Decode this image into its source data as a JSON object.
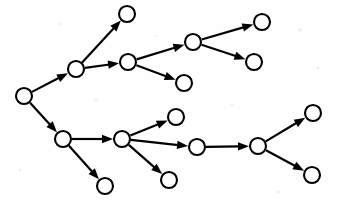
{
  "diagram": {
    "type": "node-link-diagram",
    "canvas": {
      "width": 337,
      "height": 204
    },
    "style": {
      "background_color": "#fefefe",
      "node_fill": "#ffffff",
      "node_stroke": "#000000",
      "node_radius": 8,
      "node_stroke_width": 2.1,
      "edge_color": "#000000",
      "edge_width": 2.2,
      "arrowhead_length": 11,
      "arrowhead_half_width": 4.2,
      "directed": true
    },
    "nodes": [
      {
        "id": "n0",
        "label": "",
        "x": 24,
        "y": 96,
        "role": "root"
      },
      {
        "id": "n1",
        "label": "",
        "x": 76,
        "y": 69,
        "role": "branch"
      },
      {
        "id": "n2",
        "label": "",
        "x": 127,
        "y": 14,
        "role": "leaf"
      },
      {
        "id": "n3",
        "label": "",
        "x": 128,
        "y": 62,
        "role": "branch"
      },
      {
        "id": "n4",
        "label": "",
        "x": 193,
        "y": 42,
        "role": "branch"
      },
      {
        "id": "n5",
        "label": "",
        "x": 184,
        "y": 83,
        "role": "leaf"
      },
      {
        "id": "n6",
        "label": "",
        "x": 262,
        "y": 22,
        "role": "leaf"
      },
      {
        "id": "n7",
        "label": "",
        "x": 254,
        "y": 62,
        "role": "leaf"
      },
      {
        "id": "n8",
        "label": "",
        "x": 63,
        "y": 139,
        "role": "branch"
      },
      {
        "id": "n9",
        "label": "",
        "x": 105,
        "y": 186,
        "role": "leaf"
      },
      {
        "id": "n10",
        "label": "",
        "x": 122,
        "y": 139,
        "role": "branch"
      },
      {
        "id": "n11",
        "label": "",
        "x": 176,
        "y": 117,
        "role": "leaf"
      },
      {
        "id": "n12",
        "label": "",
        "x": 197,
        "y": 147,
        "role": "branch"
      },
      {
        "id": "n13",
        "label": "",
        "x": 169,
        "y": 180,
        "role": "leaf"
      },
      {
        "id": "n14",
        "label": "",
        "x": 258,
        "y": 146,
        "role": "branch"
      },
      {
        "id": "n15",
        "label": "",
        "x": 313,
        "y": 113,
        "role": "leaf"
      },
      {
        "id": "n16",
        "label": "",
        "x": 312,
        "y": 175,
        "role": "leaf"
      }
    ],
    "edges": [
      {
        "id": "e0",
        "from": "n0",
        "to": "n1",
        "label": ""
      },
      {
        "id": "e1",
        "from": "n0",
        "to": "n8",
        "label": ""
      },
      {
        "id": "e2",
        "from": "n1",
        "to": "n2",
        "label": ""
      },
      {
        "id": "e3",
        "from": "n1",
        "to": "n3",
        "label": ""
      },
      {
        "id": "e4",
        "from": "n3",
        "to": "n4",
        "label": ""
      },
      {
        "id": "e5",
        "from": "n3",
        "to": "n5",
        "label": ""
      },
      {
        "id": "e6",
        "from": "n4",
        "to": "n6",
        "label": ""
      },
      {
        "id": "e7",
        "from": "n4",
        "to": "n7",
        "label": ""
      },
      {
        "id": "e8",
        "from": "n8",
        "to": "n10",
        "label": ""
      },
      {
        "id": "e9",
        "from": "n8",
        "to": "n9",
        "label": ""
      },
      {
        "id": "e10",
        "from": "n10",
        "to": "n11",
        "label": ""
      },
      {
        "id": "e11",
        "from": "n10",
        "to": "n12",
        "label": ""
      },
      {
        "id": "e12",
        "from": "n10",
        "to": "n13",
        "label": ""
      },
      {
        "id": "e13",
        "from": "n12",
        "to": "n14",
        "label": ""
      },
      {
        "id": "e14",
        "from": "n14",
        "to": "n15",
        "label": ""
      },
      {
        "id": "e15",
        "from": "n14",
        "to": "n16",
        "label": ""
      }
    ],
    "specks": [
      {
        "x": 300,
        "y": 30,
        "r": 1.6
      },
      {
        "x": 318,
        "y": 68,
        "r": 1.3
      },
      {
        "x": 60,
        "y": 24,
        "r": 1.4
      },
      {
        "x": 232,
        "y": 105,
        "r": 1.2
      },
      {
        "x": 96,
        "y": 100,
        "r": 1.2
      },
      {
        "x": 278,
        "y": 192,
        "r": 1.4
      },
      {
        "x": 20,
        "y": 170,
        "r": 1.2
      },
      {
        "x": 156,
        "y": 36,
        "r": 1.1
      }
    ]
  }
}
